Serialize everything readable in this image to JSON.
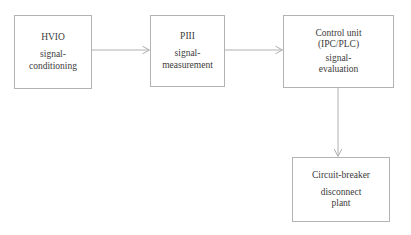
{
  "diagram": {
    "type": "flowchart",
    "background_color": "#ffffff",
    "line_color": "#b0b0b0",
    "text_color": "#3b3b3b",
    "nodes": [
      {
        "id": "hvio",
        "title": "HVIO",
        "sub_line1": "signal-",
        "sub_line2": "conditioning"
      },
      {
        "id": "piii",
        "title": "PIII",
        "sub_line1": "signal-",
        "sub_line2": "measurement"
      },
      {
        "id": "control",
        "title": "Control unit",
        "title2": "(IPC/PLC)",
        "sub_line1": "signal-",
        "sub_line2": "evaluation"
      },
      {
        "id": "breaker",
        "title": "Circuit-breaker",
        "sub_line1": "disconnect",
        "sub_line2": "plant"
      }
    ],
    "edges": [
      {
        "id": "hvio-to-piii",
        "from": "hvio",
        "to": "piii",
        "direction": "right"
      },
      {
        "id": "piii-to-control",
        "from": "piii",
        "to": "control",
        "direction": "right"
      },
      {
        "id": "control-to-breaker",
        "from": "control",
        "to": "breaker",
        "direction": "down"
      }
    ]
  }
}
